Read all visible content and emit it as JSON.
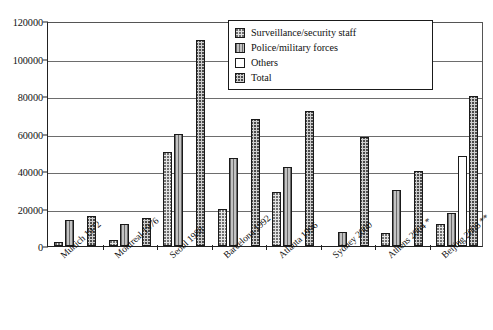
{
  "chart_data": {
    "type": "bar",
    "title": "",
    "subtitle": "",
    "xlabel": "",
    "ylabel": "",
    "ylim": [
      0,
      120000
    ],
    "ytick_interval": 20000,
    "ytick_labels": [
      "0",
      "20000",
      "40000",
      "60000",
      "80000",
      "100000",
      "120000"
    ],
    "ytick_values": [
      0,
      20000,
      40000,
      60000,
      80000,
      100000,
      120000
    ],
    "grid": "horizontal",
    "legend_position": "top-right",
    "categories": [
      "Munich 1972",
      "Montreal 1976",
      "Seoul 1988",
      "Barcelona 1992",
      "Atlanta 1996",
      "Sydney 2000",
      "Athens 2004 *",
      "Beijing 2008 **"
    ],
    "series": [
      {
        "name": "Surveillance/security staff",
        "pattern": "light-dotted",
        "values": [
          2000,
          3000,
          50000,
          20000,
          29000,
          0,
          7000,
          11500
        ]
      },
      {
        "name": "Police/military forces",
        "pattern": "vertical-striped",
        "values": [
          14000,
          12000,
          60000,
          47000,
          42000,
          7500,
          30000,
          17500
        ]
      },
      {
        "name": "Others",
        "pattern": "white",
        "values": [
          0,
          0,
          0,
          0,
          0,
          0,
          0,
          48000
        ]
      },
      {
        "name": "Total",
        "pattern": "dark-crosshatch",
        "values": [
          16000,
          15000,
          110000,
          68000,
          72000,
          58000,
          40000,
          80000
        ]
      }
    ]
  },
  "legend": {
    "items": [
      {
        "label": "Surveillance/security staff",
        "swatch": "legend-swatch-surveillance"
      },
      {
        "label": "Police/military forces",
        "swatch": "legend-swatch-police"
      },
      {
        "label": "Others",
        "swatch": "legend-swatch-others"
      },
      {
        "label": "Total",
        "swatch": "legend-swatch-total"
      }
    ]
  }
}
